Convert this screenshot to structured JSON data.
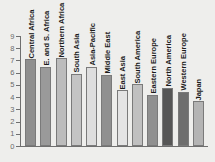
{
  "chart_data": {
    "type": "bar",
    "title": "",
    "subtitle": "",
    "xlabel": "",
    "ylabel": "",
    "ylim": [
      0,
      9
    ],
    "grid": false,
    "legend": "none",
    "y_ticks": [
      "9",
      "8",
      "7",
      "6",
      "5",
      "4",
      "3",
      "2",
      "1",
      "0"
    ],
    "categories": [
      "Central Africa",
      "E. and S. Africa",
      "Northern Africa",
      "South Asia",
      "Asia-Pacific",
      "Middle East",
      "East Asia",
      "South America",
      "Eastern Europe",
      "North America",
      "Western Europe",
      "Japan"
    ],
    "values": [
      7.1,
      6.5,
      7.2,
      5.9,
      6.5,
      5.85,
      4.55,
      5.05,
      4.2,
      4.75,
      4.45,
      3.65
    ],
    "bar_colors": [
      "#8f8f8f",
      "#9a9a9a",
      "#bcbcbc",
      "#c4c4c4",
      "#dedede",
      "#909090",
      "#e4e4e4",
      "#c0c0c0",
      "#909090",
      "#565656",
      "#6e6e6e",
      "#b4b4b4"
    ],
    "axis_color": "#6f6f6f",
    "tick_label_color": "#6b6b6b",
    "bar_label_color": "#1b1b1b",
    "background_color": "#eeeeec"
  }
}
